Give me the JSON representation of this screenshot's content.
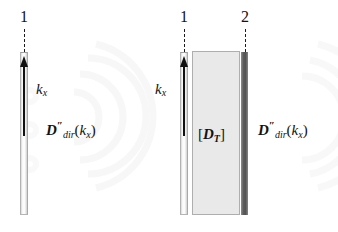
{
  "figure": {
    "type": "physics-schematic",
    "background_color": "#ffffff",
    "ink_color": "#131313"
  },
  "watermark": {
    "description": "faint concentric arc rings",
    "color": "#f2f2f2",
    "visible": true
  },
  "panels": [
    {
      "id": "left-panel",
      "name": "single-interface",
      "interface_labels": [
        "1"
      ],
      "bars": [
        {
          "id": "bar-1",
          "label": "1",
          "kind": "light",
          "x": 20,
          "y": 52,
          "w": 8,
          "h": 163,
          "fill": "#fbfbfb",
          "stroke": "#aaaaaa"
        }
      ],
      "dashed_guides": [
        {
          "for": "1",
          "x": 24,
          "y": 29,
          "h": 23
        }
      ],
      "arrow": {
        "name": "wavevector-arrow",
        "direction": "up",
        "x": 24,
        "y_tip": 56,
        "y_tail": 136,
        "color": "#111111"
      },
      "labels": [
        {
          "name": "kx-label",
          "tex": "k_x",
          "base": "k",
          "sub": "x",
          "x": 36,
          "y": 85
        },
        {
          "name": "ddir-label",
          "tex": "D''_{dir}(k_x)",
          "base": "D",
          "prime": "″",
          "sub": "dir",
          "arg_base": "k",
          "arg_sub": "x",
          "x": 46,
          "y": 124
        }
      ]
    },
    {
      "id": "right-panel",
      "name": "layered-interface",
      "interface_labels": [
        "1",
        "2"
      ],
      "bars": [
        {
          "id": "bar-1",
          "label": "1",
          "kind": "light",
          "x": 180,
          "y": 52,
          "w": 8,
          "h": 163,
          "fill": "#fbfbfb",
          "stroke": "#aaaaaa"
        },
        {
          "id": "bar-2",
          "label": "2",
          "kind": "dark",
          "x": 241,
          "y": 52,
          "w": 7,
          "h": 163,
          "fill": "#585858",
          "stroke": "#585858"
        }
      ],
      "slab": {
        "name": "transfer-matrix-slab",
        "label_tex": "[D_T]",
        "label_base": "D",
        "label_sub": "T",
        "bracket_open": "[",
        "bracket_close": "]",
        "x": 192,
        "y": 51,
        "w": 48,
        "h": 164,
        "fill": "#e9e9e9",
        "stroke": "#aeaeae"
      },
      "dashed_guides": [
        {
          "for": "1",
          "x": 184,
          "y": 29,
          "h": 23
        },
        {
          "for": "2",
          "x": 245,
          "y": 29,
          "h": 23
        }
      ],
      "arrow": {
        "name": "wavevector-arrow",
        "direction": "up",
        "x": 184,
        "y_tip": 56,
        "y_tail": 136,
        "color": "#111111"
      },
      "labels": [
        {
          "name": "kx-label",
          "tex": "k_x",
          "base": "k",
          "sub": "x",
          "x": 155,
          "y": 85
        },
        {
          "name": "ddir-label",
          "tex": "D''_{dir}(k_x)",
          "base": "D",
          "prime": "″",
          "sub": "dir",
          "arg_base": "k",
          "arg_sub": "x",
          "x": 258,
          "y": 124
        }
      ]
    }
  ],
  "text": {
    "left": {
      "num_1": "1",
      "kx_base": "k",
      "kx_sub": "x",
      "d_base": "D",
      "d_prime": "″",
      "d_sub": "dir",
      "paren_open": "(",
      "arg_base": "k",
      "arg_sub": "x",
      "paren_close": ")"
    },
    "right": {
      "num_1": "1",
      "num_2": "2",
      "kx_base": "k",
      "kx_sub": "x",
      "d_base": "D",
      "d_prime": "″",
      "d_sub": "dir",
      "paren_open": "(",
      "arg_base": "k",
      "arg_sub": "x",
      "paren_close": ")",
      "dt_open": "[",
      "dt_base": "D",
      "dt_sub": "T",
      "dt_close": "]"
    }
  }
}
